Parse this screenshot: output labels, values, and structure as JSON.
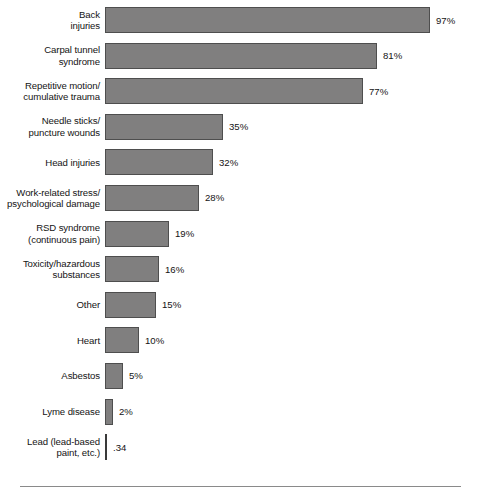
{
  "chart_data": {
    "type": "bar",
    "orientation": "horizontal",
    "title": "",
    "subtitle": "",
    "xlabel": "",
    "ylabel": "",
    "grid": false,
    "legend": null,
    "xlim": [
      0,
      97
    ],
    "value_unit": "%",
    "bar_color": "#807f7f",
    "bar_border_color": "#4e4e4e",
    "text_color": "#141414",
    "rule_color": "#8a8a8a",
    "categories": [
      "Back\ninjuries",
      "Carpal tunnel\nsyndrome",
      "Repetitive motion/\ncumulative trauma",
      "Needle sticks/\npuncture wounds",
      "Head injuries",
      "Work-related stress/\npsychological damage",
      "RSD syndrome\n(continuous pain)",
      "Toxicity/hazardous\nsubstances",
      "Other",
      "Heart",
      "Asbestos",
      "Lyme disease",
      "Lead (lead-based\npaint, etc.)"
    ],
    "values": [
      97,
      81,
      77,
      35,
      32,
      28,
      19,
      16,
      15,
      10,
      5,
      2,
      0.34
    ],
    "value_labels": [
      "97%",
      "81%",
      "77%",
      "35%",
      "32%",
      "28%",
      "19%",
      "16%",
      "15%",
      "10%",
      "5%",
      "2%",
      ".34"
    ]
  },
  "bars": [
    {
      "label": "Back\ninjuries",
      "value": 97,
      "value_label": "97%",
      "width_px": 325
    },
    {
      "label": "Carpal tunnel\nsyndrome",
      "value": 81,
      "value_label": "81%",
      "width_px": 272
    },
    {
      "label": "Repetitive motion/\ncumulative trauma",
      "value": 77,
      "value_label": "77%",
      "width_px": 258
    },
    {
      "label": "Needle sticks/\npuncture wounds",
      "value": 35,
      "value_label": "35%",
      "width_px": 118
    },
    {
      "label": "Head injuries",
      "value": 32,
      "value_label": "32%",
      "width_px": 108
    },
    {
      "label": "Work-related stress/\npsychological damage",
      "value": 28,
      "value_label": "28%",
      "width_px": 94
    },
    {
      "label": "RSD syndrome\n(continuous pain)",
      "value": 19,
      "value_label": "19%",
      "width_px": 64
    },
    {
      "label": "Toxicity/hazardous\nsubstances",
      "value": 16,
      "value_label": "16%",
      "width_px": 54
    },
    {
      "label": "Other",
      "value": 15,
      "value_label": "15%",
      "width_px": 51
    },
    {
      "label": "Heart",
      "value": 10,
      "value_label": "10%",
      "width_px": 34
    },
    {
      "label": "Asbestos",
      "value": 5,
      "value_label": "5%",
      "width_px": 18
    },
    {
      "label": "Lyme disease",
      "value": 2,
      "value_label": "2%",
      "width_px": 8
    },
    {
      "label": "Lead (lead-based\npaint, etc.)",
      "value": 0.34,
      "value_label": ".34",
      "width_px": 2
    }
  ]
}
